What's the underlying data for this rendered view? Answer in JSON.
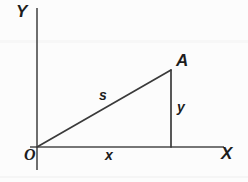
{
  "figure": {
    "type": "geometry-diagram",
    "background_color": "#fcfcfc",
    "stroke_color": "#3a3a3a",
    "text_color": "#1d1d1d"
  },
  "labels": {
    "y_axis": "Y",
    "x_axis": "X",
    "origin": "O",
    "vertex_a": "A",
    "hypotenuse": "s",
    "horizontal_leg": "x",
    "vertical_leg": "y"
  },
  "geometry": {
    "origin": {
      "x": 37,
      "y": 147
    },
    "vertex_a": {
      "x": 171,
      "y": 70
    },
    "foot": {
      "x": 171,
      "y": 147
    },
    "y_axis_line": {
      "x1": 37,
      "y1": 8,
      "x2": 37,
      "y2": 170
    },
    "x_axis_line": {
      "x1": 30,
      "y1": 147,
      "x2": 224,
      "y2": 147
    },
    "hypotenuse_line": {
      "x1": 37,
      "y1": 147,
      "x2": 171,
      "y2": 70
    },
    "vertical_leg_line": {
      "x1": 171,
      "y1": 70,
      "x2": 171,
      "y2": 147
    }
  }
}
